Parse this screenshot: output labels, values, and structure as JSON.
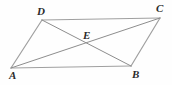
{
  "figure": {
    "kind": "geometry-diagram",
    "shape_name": "parallelogram",
    "width": 172,
    "height": 85,
    "background_color": "#fefefe",
    "stroke_color": "#a0a0a0",
    "stroke_color_dark": "#8d8d8d",
    "label_color": "#2b2b2b",
    "stroke_width": 1
  },
  "points": {
    "A": {
      "label": "A",
      "x": 11,
      "y": 68,
      "label_x": 9,
      "label_y": 70
    },
    "B": {
      "label": "B",
      "x": 131,
      "y": 66,
      "label_x": 132,
      "label_y": 69
    },
    "C": {
      "label": "C",
      "x": 160,
      "y": 18,
      "label_x": 156,
      "label_y": 3
    },
    "D": {
      "label": "D",
      "x": 42,
      "y": 20,
      "label_x": 37,
      "label_y": 6
    },
    "E": {
      "label": "E",
      "x": 86,
      "y": 43,
      "label_x": 83,
      "label_y": 30
    }
  },
  "segments": [
    {
      "name": "side-AB",
      "from": "A",
      "to": "B",
      "kind": "side"
    },
    {
      "name": "side-BC",
      "from": "B",
      "to": "C",
      "kind": "side"
    },
    {
      "name": "side-CD",
      "from": "C",
      "to": "D",
      "kind": "side"
    },
    {
      "name": "side-DA",
      "from": "D",
      "to": "A",
      "kind": "side"
    },
    {
      "name": "diagonal-AC",
      "from": "A",
      "to": "C",
      "kind": "diagonal"
    },
    {
      "name": "diagonal-BD",
      "from": "B",
      "to": "D",
      "kind": "diagonal"
    }
  ]
}
